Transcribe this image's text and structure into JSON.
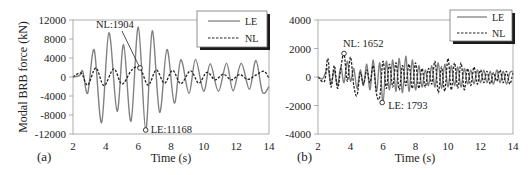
{
  "chart_data": [
    {
      "panel": "(a)",
      "type": "line",
      "title": "",
      "xlabel": "Time (s)",
      "ylabel": "Modal BRB force (kN)",
      "xlim": [
        2,
        14
      ],
      "ylim": [
        -12000,
        12000
      ],
      "xticks": [
        "2",
        "4",
        "6",
        "8",
        "10",
        "12",
        "14"
      ],
      "yticks": [
        "12000",
        "8000",
        "4000",
        "0",
        "-4000",
        "-8000",
        "-12000"
      ],
      "grid": false,
      "legend": {
        "position": "upper right",
        "entries": [
          "LE",
          "NL"
        ]
      },
      "series": [
        {
          "name": "LE",
          "style": "solid",
          "color": "#808080",
          "x": [
            2.0,
            2.4,
            2.6,
            2.9,
            3.3,
            3.75,
            4.2,
            4.7,
            5.1,
            5.55,
            6.0,
            6.45,
            6.85,
            7.3,
            7.75,
            8.2,
            8.6,
            9.1,
            9.5,
            10.0,
            10.4,
            10.9,
            11.4,
            11.8,
            12.3,
            12.8,
            13.2,
            13.6,
            14.0
          ],
          "y": [
            0,
            300,
            1200,
            -3400,
            5700,
            -9600,
            9300,
            -7200,
            6800,
            -9300,
            10500,
            -11168,
            9700,
            -7400,
            5800,
            -5500,
            3600,
            -3400,
            3700,
            -3000,
            2800,
            -3000,
            2900,
            -2900,
            2900,
            -2600,
            3500,
            -3200,
            -2000
          ]
        },
        {
          "name": "NL",
          "style": "dashed",
          "color": "#222222",
          "x": [
            2.0,
            2.5,
            2.9,
            3.4,
            3.9,
            4.5,
            5.0,
            5.6,
            6.1,
            6.6,
            7.1,
            7.6,
            8.1,
            8.6,
            9.2,
            9.7,
            10.2,
            10.7,
            11.2,
            11.7,
            12.2,
            12.7,
            13.2,
            13.7,
            14.0
          ],
          "y": [
            0,
            800,
            -1700,
            1900,
            -1800,
            1700,
            -1500,
            1500,
            1904,
            -1700,
            1500,
            -1300,
            1400,
            -1400,
            1300,
            -1300,
            1000,
            -600,
            600,
            -600,
            500,
            -500,
            400,
            1200,
            -300
          ]
        }
      ],
      "annotations": [
        {
          "text": "NL:1904",
          "x": 6.1,
          "y": 1904,
          "marker": "circle",
          "leader_line": true
        },
        {
          "text": "LE:11168",
          "x": 6.45,
          "y": -11168,
          "marker": "circle"
        }
      ]
    },
    {
      "panel": "(b)",
      "type": "line",
      "title": "",
      "xlabel": "Time (s)",
      "ylabel": "",
      "xlim": [
        2,
        14
      ],
      "ylim": [
        -4000,
        4000
      ],
      "xticks": [
        "2",
        "4",
        "6",
        "8",
        "10",
        "12",
        "14"
      ],
      "yticks": [
        "4000",
        "2000",
        "0",
        "-2000",
        "-4000"
      ],
      "grid": false,
      "legend": {
        "position": "upper right",
        "entries": [
          "LE",
          "NL"
        ]
      },
      "series": [
        {
          "name": "LE",
          "style": "solid",
          "color": "#808080",
          "x": [
            2.0,
            2.3,
            2.6,
            2.8,
            3.0,
            3.2,
            3.4,
            3.6,
            3.8,
            4.0,
            4.2,
            4.4,
            4.6,
            4.8,
            5.0,
            5.2,
            5.4,
            5.6,
            5.8,
            6.0,
            6.2,
            6.4,
            6.6,
            6.8,
            7.0,
            7.2,
            7.4,
            7.6,
            7.8,
            8.0,
            8.2,
            8.4,
            8.6,
            8.8,
            9.0,
            9.2,
            9.4,
            9.6,
            9.8,
            10.0,
            10.2,
            10.4,
            10.6,
            10.8,
            11.0,
            11.2,
            11.4,
            11.6,
            11.8,
            12.0,
            12.2,
            12.4,
            12.6,
            12.8,
            13.0,
            13.2,
            13.4,
            13.6,
            13.8,
            14.0
          ],
          "y": [
            0,
            -100,
            600,
            -500,
            500,
            -600,
            700,
            -400,
            1100,
            -300,
            600,
            -800,
            500,
            -600,
            900,
            -900,
            1200,
            -1000,
            1000,
            -1793,
            1100,
            -900,
            1200,
            -1000,
            1300,
            -1100,
            1450,
            -1000,
            1200,
            -900,
            800,
            -700,
            500,
            -600,
            800,
            -700,
            1000,
            -800,
            900,
            -700,
            800,
            -600,
            700,
            -700,
            600,
            -500,
            500,
            -500,
            500,
            -400,
            500,
            -400,
            400,
            -500,
            500,
            -400,
            400,
            -500,
            300,
            400
          ]
        },
        {
          "name": "NL",
          "style": "dashed",
          "color": "#222222",
          "x": [
            2.0,
            2.4,
            2.6,
            2.8,
            3.0,
            3.2,
            3.4,
            3.6,
            3.8,
            4.0,
            4.2,
            4.4,
            4.6,
            4.8,
            5.0,
            5.2,
            5.4,
            5.6,
            5.8,
            6.0,
            6.2,
            6.4,
            6.6,
            6.8,
            7.0,
            7.2,
            7.4,
            7.6,
            7.8,
            8.0,
            8.2,
            8.4,
            8.6,
            8.8,
            9.0,
            9.2,
            9.4,
            9.6,
            9.8,
            10.0,
            10.2,
            10.4,
            10.6,
            10.8,
            11.0,
            11.2,
            11.4,
            11.6,
            11.8,
            12.0,
            12.2,
            12.4,
            12.6,
            12.8,
            13.0,
            13.2,
            13.4,
            13.6,
            13.8,
            14.0
          ],
          "y": [
            0,
            -300,
            1300,
            -700,
            800,
            -800,
            600,
            1652,
            -300,
            1400,
            -600,
            -1300,
            300,
            -500,
            500,
            -400,
            800,
            -1200,
            -1400,
            1100,
            -800,
            900,
            -700,
            1000,
            -900,
            800,
            -600,
            900,
            -800,
            1000,
            -800,
            600,
            -700,
            600,
            -500,
            1100,
            -1100,
            700,
            -1000,
            1300,
            -900,
            1000,
            -800,
            1000,
            -900,
            600,
            -600,
            700,
            -500,
            500,
            -400,
            400,
            -500,
            300,
            -300,
            500,
            -400,
            400,
            -500,
            300
          ]
        }
      ],
      "annotations": [
        {
          "text": "NL: 1652",
          "x": 3.6,
          "y": 1652,
          "marker": "circle"
        },
        {
          "text": "LE: 1793",
          "x": 5.95,
          "y": -1793,
          "marker": "circle"
        }
      ]
    }
  ]
}
